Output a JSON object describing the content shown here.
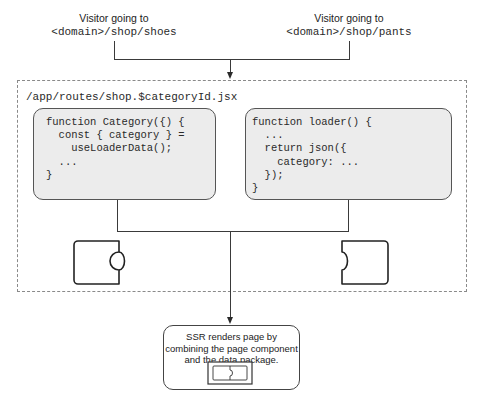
{
  "visitors": [
    {
      "label": "Visitor going to",
      "url": "<domain>/shop/shoes"
    },
    {
      "label": "Visitor going to",
      "url": "<domain>/shop/pants"
    }
  ],
  "route_file": {
    "path": "/app/routes/shop.$categoryId.jsx",
    "component_code": [
      "function Category({) {",
      "  const { category } =",
      "    useLoaderData();",
      "  ...",
      "}"
    ],
    "loader_code": [
      "function loader() {",
      "  ...",
      "  return json({",
      "    category: ...",
      "  });",
      "}"
    ]
  },
  "pieces": {
    "left": "page-component-puzzle-piece",
    "right": "data-package-puzzle-piece"
  },
  "ssr": {
    "text_lines": [
      "SSR renders page by",
      "combining the page component",
      "and the data package."
    ],
    "icon": "combined-puzzle-icon"
  },
  "colors": {
    "code_box_fill": "#ececec",
    "stroke": "#3a3a3a",
    "dashed_border": "#8a8a8a"
  }
}
